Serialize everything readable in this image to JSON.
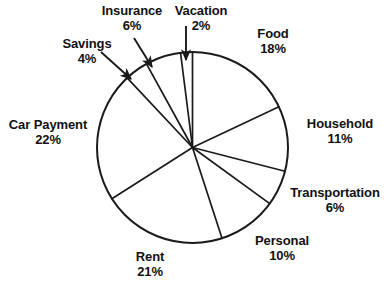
{
  "chart_data": {
    "type": "pie",
    "title": "",
    "subtitle": "",
    "xlabel": "",
    "ylabel": "",
    "legend_position": "none",
    "grid": false,
    "total": 100,
    "units": "%",
    "start_angle_deg": 0,
    "direction": "clockwise",
    "stroke_color": "#1a1a1a",
    "fill_color": "#ffffff",
    "categories": [
      "Food",
      "Household",
      "Transportation",
      "Personal",
      "Rent",
      "Car Payment",
      "Savings",
      "Insurance",
      "Vacation"
    ],
    "values": [
      18,
      11,
      6,
      10,
      21,
      22,
      4,
      6,
      2
    ],
    "slices": [
      {
        "label": "Food",
        "value": 18,
        "pct_text": "18%",
        "start_deg": 0,
        "end_deg": 64.8,
        "leader": false
      },
      {
        "label": "Household",
        "value": 11,
        "pct_text": "11%",
        "start_deg": 64.8,
        "end_deg": 104.4,
        "leader": false
      },
      {
        "label": "Transportation",
        "value": 6,
        "pct_text": "6%",
        "start_deg": 104.4,
        "end_deg": 126.0,
        "leader": false
      },
      {
        "label": "Personal",
        "value": 10,
        "pct_text": "10%",
        "start_deg": 126.0,
        "end_deg": 162.0,
        "leader": false
      },
      {
        "label": "Rent",
        "value": 21,
        "pct_text": "21%",
        "start_deg": 162.0,
        "end_deg": 237.6,
        "leader": false
      },
      {
        "label": "Car Payment",
        "value": 22,
        "pct_text": "22%",
        "start_deg": 237.6,
        "end_deg": 316.8,
        "leader": false
      },
      {
        "label": "Savings",
        "value": 4,
        "pct_text": "4%",
        "start_deg": 316.8,
        "end_deg": 331.2,
        "leader": true
      },
      {
        "label": "Insurance",
        "value": 6,
        "pct_text": "6%",
        "start_deg": 331.2,
        "end_deg": 352.8,
        "leader": true
      },
      {
        "label": "Vacation",
        "value": 2,
        "pct_text": "2%",
        "start_deg": 352.8,
        "end_deg": 360.0,
        "leader": true
      }
    ]
  },
  "labels": {
    "food": {
      "name": "Food",
      "pct": "18%"
    },
    "household": {
      "name": "Household",
      "pct": "11%"
    },
    "transportation": {
      "name": "Transportation",
      "pct": "6%"
    },
    "personal": {
      "name": "Personal",
      "pct": "10%"
    },
    "rent": {
      "name": "Rent",
      "pct": "21%"
    },
    "car_payment": {
      "name": "Car Payment",
      "pct": "22%"
    },
    "savings": {
      "name": "Savings",
      "pct": "4%"
    },
    "insurance": {
      "name": "Insurance",
      "pct": "6%"
    },
    "vacation": {
      "name": "Vacation",
      "pct": "2%"
    }
  }
}
